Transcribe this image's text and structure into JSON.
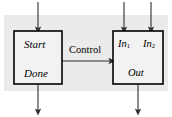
{
  "diagram": {
    "background": {
      "page_color": "#ffffff",
      "panel_color": "#ebebeb"
    },
    "style": {
      "box_fill": "#f2f2f2",
      "box_stroke": "#000000",
      "arrow_color": "#3a3a3a",
      "text_color": "#000000"
    },
    "left_block": {
      "name": "controller-block",
      "top_label": "Start",
      "bottom_label": "Done"
    },
    "right_block": {
      "name": "datapath-block",
      "input_label_1": "In",
      "input_sub_1": "1",
      "input_label_2": "In",
      "input_sub_2": "2",
      "output_label": "Out"
    },
    "connection": {
      "label": "Control"
    },
    "arrows": [
      {
        "name": "start-input-arrow",
        "direction": "down"
      },
      {
        "name": "done-output-arrow",
        "direction": "down"
      },
      {
        "name": "in1-input-arrow",
        "direction": "down"
      },
      {
        "name": "in2-input-arrow",
        "direction": "down"
      },
      {
        "name": "out-output-arrow",
        "direction": "down"
      },
      {
        "name": "control-arrow",
        "direction": "right"
      }
    ]
  }
}
